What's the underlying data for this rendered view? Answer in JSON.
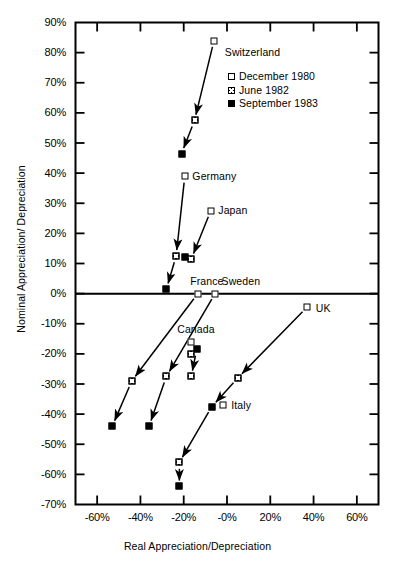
{
  "chart_data": {
    "type": "scatter",
    "title": "",
    "xlabel": "Real Appreciation/Depreciation",
    "ylabel": "Nominal Appreciation/ Depreciation",
    "xlim": [
      -70,
      70
    ],
    "ylim": [
      -70,
      90
    ],
    "grid": false,
    "legend_position": "inside-upper-right",
    "xticks": [
      -60,
      -40,
      -20,
      0,
      20,
      40,
      60
    ],
    "xtick_labels": [
      "-60%",
      "-40%",
      "-20%",
      "-0%",
      "20%",
      "40%",
      "60%"
    ],
    "yticks": [
      90,
      80,
      70,
      60,
      50,
      40,
      30,
      20,
      10,
      0,
      -10,
      -20,
      -30,
      -40,
      -50,
      -60,
      -70
    ],
    "ytick_labels": [
      "90%",
      "80%",
      "70%",
      "60%",
      "50%",
      "40%",
      "30%",
      "20%",
      "10%",
      "0%",
      "-10%",
      "-20%",
      "-30%",
      "-40%",
      "-50%",
      "-60%",
      "-70%"
    ],
    "legend": [
      {
        "label": "December 1980",
        "marker": "open-square"
      },
      {
        "label": "June 1982",
        "marker": "crosshatch-square"
      },
      {
        "label": "September 1983",
        "marker": "filled-square"
      }
    ],
    "series": [
      {
        "name": "Switzerland",
        "label_x": -1,
        "label_y": 80,
        "points": [
          {
            "period": "December 1980",
            "marker": "open-square",
            "x": -6,
            "y": 84
          },
          {
            "period": "June 1982",
            "marker": "crosshatch-square",
            "x": -15,
            "y": 57.5
          },
          {
            "period": "September 1983",
            "marker": "filled-square",
            "x": -21,
            "y": 46.5
          }
        ]
      },
      {
        "name": "Germany",
        "label_x": -16,
        "label_y": 39,
        "points": [
          {
            "period": "December 1980",
            "marker": "open-square",
            "x": -19.5,
            "y": 39
          },
          {
            "period": "June 1982",
            "marker": "crosshatch-square",
            "x": -23.5,
            "y": 12.5
          },
          {
            "period": "September 1983",
            "marker": "filled-square",
            "x": -28,
            "y": 1.5
          }
        ]
      },
      {
        "name": "Japan",
        "label_x": -4,
        "label_y": 27.5,
        "points": [
          {
            "period": "December 1980",
            "marker": "open-square",
            "x": -7.5,
            "y": 27.5
          },
          {
            "period": "September 1983",
            "marker": "filled-square",
            "x": -19.5,
            "y": 12
          },
          {
            "period": "June 1982",
            "marker": "crosshatch-square",
            "x": -16.5,
            "y": 11.5
          }
        ]
      },
      {
        "name": "France",
        "label_x": -17,
        "label_y": 4,
        "points": [
          {
            "period": "December 1980",
            "marker": "open-square",
            "x": -13.5,
            "y": 0
          },
          {
            "period": "June 1982",
            "marker": "crosshatch-square",
            "x": -44,
            "y": -29
          },
          {
            "period": "September 1983",
            "marker": "filled-square",
            "x": -53,
            "y": -44
          }
        ]
      },
      {
        "name": "Sweden",
        "label_x": -2.5,
        "label_y": 4,
        "points": [
          {
            "period": "December 1980",
            "marker": "open-square",
            "x": -5.5,
            "y": 0
          },
          {
            "period": "June 1982",
            "marker": "crosshatch-square",
            "x": -28,
            "y": -27.5
          },
          {
            "period": "September 1983",
            "marker": "filled-square",
            "x": -36,
            "y": -44
          }
        ]
      },
      {
        "name": "Canada",
        "label_x": -23,
        "label_y": -12,
        "points": [
          {
            "period": "December 1980",
            "marker": "open-square",
            "x": -16.5,
            "y": -16
          },
          {
            "period": "September 1983",
            "marker": "filled-square",
            "x": -14,
            "y": -18.5
          },
          {
            "period": "June 1982",
            "marker": "crosshatch-square",
            "x": -16.5,
            "y": -20
          },
          {
            "period": "June 1982",
            "marker": "crosshatch-square",
            "x": -16.5,
            "y": -27.5
          }
        ]
      },
      {
        "name": "UK",
        "label_x": 41,
        "label_y": -5,
        "points": [
          {
            "period": "December 1980",
            "marker": "open-square",
            "x": 37,
            "y": -4.5
          },
          {
            "period": "June 1982",
            "marker": "crosshatch-square",
            "x": 5,
            "y": -28
          }
        ]
      },
      {
        "name": "Italy",
        "label_x": 2,
        "label_y": -37,
        "points": [
          {
            "period": "December 1980",
            "marker": "open-square",
            "x": -2,
            "y": -37
          },
          {
            "period": "September 1983",
            "marker": "filled-square",
            "x": -7,
            "y": -37.5
          },
          {
            "period": "June 1982",
            "marker": "crosshatch-square",
            "x": -22,
            "y": -56
          },
          {
            "period": "September 1983",
            "marker": "filled-square",
            "x": -22,
            "y": -64
          }
        ]
      }
    ],
    "arrows": [
      {
        "series": "Switzerland",
        "from": [
          -6,
          84
        ],
        "to": [
          -15,
          57.5
        ]
      },
      {
        "series": "Switzerland",
        "from": [
          -15,
          57.5
        ],
        "to": [
          -21,
          46.5
        ]
      },
      {
        "series": "Germany",
        "from": [
          -19.5,
          39
        ],
        "to": [
          -23.5,
          12.5
        ]
      },
      {
        "series": "Germany",
        "from": [
          -23.5,
          12.5
        ],
        "to": [
          -28,
          1.5
        ]
      },
      {
        "series": "Japan",
        "from": [
          -7.5,
          27.5
        ],
        "to": [
          -16.5,
          11.5
        ]
      },
      {
        "series": "France",
        "from": [
          -13.5,
          0
        ],
        "to": [
          -44,
          -29
        ]
      },
      {
        "series": "France",
        "from": [
          -44,
          -29
        ],
        "to": [
          -53,
          -44
        ]
      },
      {
        "series": "Sweden",
        "from": [
          -5.5,
          0
        ],
        "to": [
          -28,
          -27.5
        ]
      },
      {
        "series": "Sweden",
        "from": [
          -28,
          -27.5
        ],
        "to": [
          -36,
          -44
        ]
      },
      {
        "series": "Canada",
        "from": [
          -14,
          -18.5
        ],
        "to": [
          -16.5,
          -27.5
        ]
      },
      {
        "series": "UK",
        "from": [
          37,
          -4.5
        ],
        "to": [
          5,
          -28
        ]
      },
      {
        "series": "UK",
        "from": [
          5,
          -28
        ],
        "to": [
          -7,
          -37.5
        ]
      },
      {
        "series": "Italy",
        "from": [
          -7,
          -37.5
        ],
        "to": [
          -22,
          -56
        ]
      },
      {
        "series": "Italy",
        "from": [
          -22,
          -56
        ],
        "to": [
          -22,
          -64
        ]
      }
    ]
  },
  "caption": ""
}
